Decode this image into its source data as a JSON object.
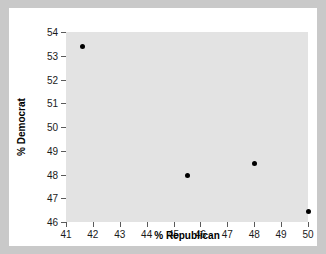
{
  "chart_data": {
    "type": "scatter",
    "title": "",
    "xlabel": "% Republican",
    "ylabel": "% Democrat",
    "xlim": [
      41,
      50
    ],
    "ylim": [
      46,
      54
    ],
    "xticks": [
      41,
      42,
      43,
      44,
      45,
      46,
      47,
      48,
      49,
      50
    ],
    "yticks": [
      46,
      47,
      48,
      49,
      50,
      51,
      52,
      53,
      54
    ],
    "grid": false,
    "legend": "none",
    "points": [
      {
        "x": 41.6,
        "y": 53.4
      },
      {
        "x": 45.5,
        "y": 47.95
      },
      {
        "x": 48.0,
        "y": 48.45
      },
      {
        "x": 50.0,
        "y": 46.45
      }
    ],
    "marker": {
      "shape": "circle",
      "color": "#000000",
      "size": 5
    },
    "panel_color": "#e3e3e3",
    "figure_color": "#ffffff",
    "outer_color": "#c9c9c9"
  }
}
